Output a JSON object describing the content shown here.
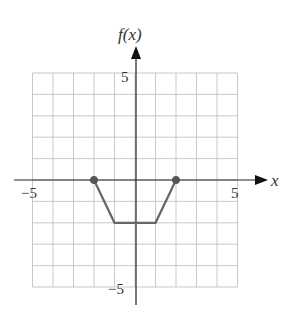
{
  "chart_data": {
    "type": "line",
    "title": "",
    "xlabel": "x",
    "ylabel": "f(x)",
    "xlim": [
      -5,
      5
    ],
    "ylim": [
      -5,
      5
    ],
    "grid": true,
    "x_ticks_labeled": [
      "-5",
      "5"
    ],
    "y_ticks_labeled": [
      "5",
      "-5"
    ],
    "series": [
      {
        "name": "f(x)",
        "points": [
          [
            -2,
            0
          ],
          [
            -1,
            -2
          ],
          [
            1,
            -2
          ],
          [
            2,
            0
          ]
        ],
        "endpoints": [
          {
            "x": -2,
            "y": 0,
            "style": "closed"
          },
          {
            "x": 2,
            "y": 0,
            "style": "closed"
          }
        ]
      }
    ],
    "colors": {
      "curve": "#666666",
      "grid": "#bbbbbb",
      "axis": "#222222"
    }
  },
  "labels": {
    "y_axis": "f(x)",
    "x_axis": "x",
    "x_min": "−5",
    "x_max": "5",
    "y_max": "5",
    "y_min": "−5"
  }
}
